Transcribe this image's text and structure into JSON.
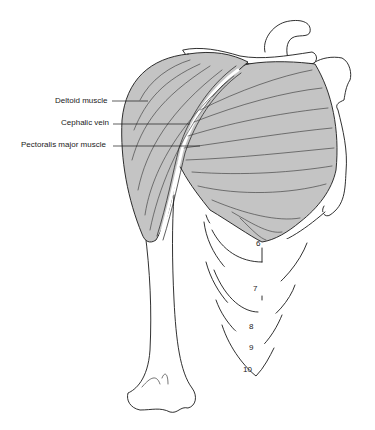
{
  "labels": [
    {
      "id": "deltoid",
      "text": "Deltoid muscle",
      "x": 55,
      "y": 96,
      "line": [
        112,
        102,
        146,
        102
      ]
    },
    {
      "id": "cephalic",
      "text": "Cephalic vein",
      "x": 61,
      "y": 118,
      "line": [
        113,
        124,
        192,
        124
      ]
    },
    {
      "id": "pectoralis",
      "text": "Pectoralis major muscle",
      "x": 21,
      "y": 140,
      "line": [
        113,
        146,
        200,
        146
      ]
    }
  ],
  "rib_numbers": [
    {
      "text": "6",
      "x": 256,
      "y": 239
    },
    {
      "text": "7",
      "x": 253,
      "y": 284
    },
    {
      "text": "8",
      "x": 249,
      "y": 322
    },
    {
      "text": "9",
      "x": 249,
      "y": 343
    },
    {
      "text": "10",
      "x": 243,
      "y": 365
    }
  ],
  "colors": {
    "muscle": "#c4c4c4",
    "outline": "#1a1a1a",
    "background": "#ffffff"
  }
}
